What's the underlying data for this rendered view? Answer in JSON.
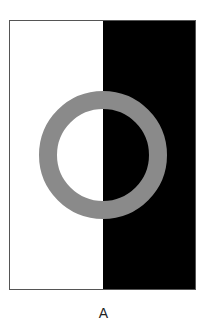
{
  "figure": {
    "label": "A",
    "frame": {
      "x": 9,
      "y": 20,
      "width": 187,
      "height": 270,
      "border_color": "#555555"
    },
    "left_half": {
      "color": "#ffffff"
    },
    "right_half": {
      "x": 103,
      "color": "#000000"
    },
    "ring": {
      "cx": 103,
      "cy": 155,
      "outer_radius": 64,
      "thickness": 18,
      "color": "#8a8a8a"
    }
  }
}
